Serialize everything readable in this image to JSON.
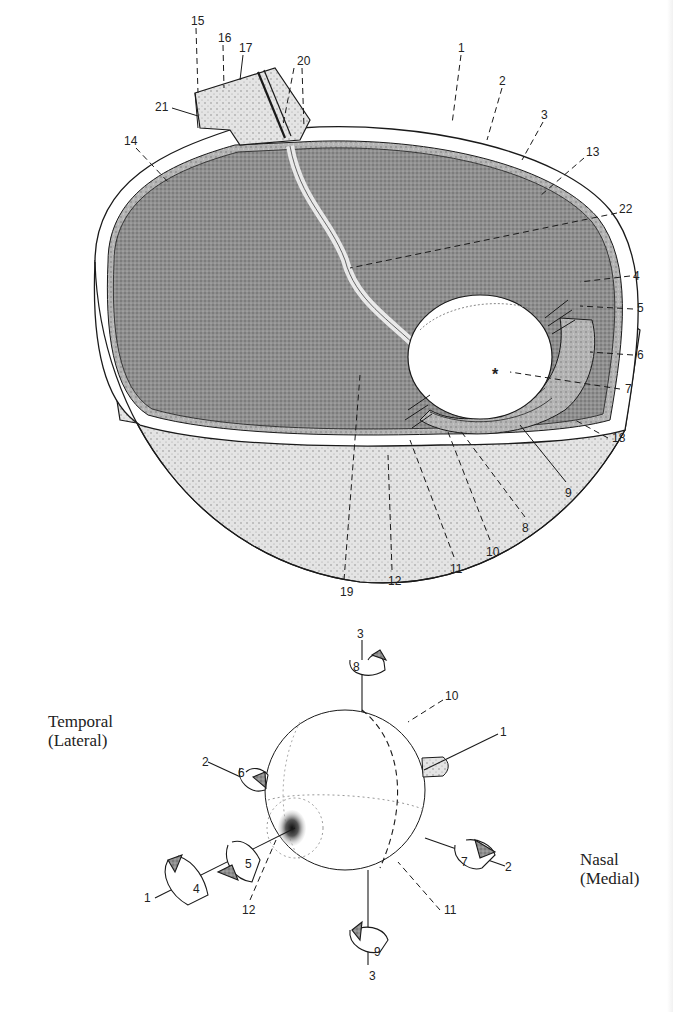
{
  "figure": {
    "top": {
      "title": "Eye cross-section (cut-away globe)",
      "labels": [
        {
          "id": "1",
          "text": "1",
          "x": 458,
          "y": 42
        },
        {
          "id": "2",
          "text": "2",
          "x": 499,
          "y": 75
        },
        {
          "id": "3",
          "text": "3",
          "x": 541,
          "y": 109
        },
        {
          "id": "13",
          "text": "13",
          "x": 586,
          "y": 146
        },
        {
          "id": "22",
          "text": "22",
          "x": 619,
          "y": 203
        },
        {
          "id": "4",
          "text": "4",
          "x": 633,
          "y": 270
        },
        {
          "id": "5",
          "text": "5",
          "x": 637,
          "y": 302
        },
        {
          "id": "6",
          "text": "6",
          "x": 637,
          "y": 349
        },
        {
          "id": "7",
          "text": "7",
          "x": 625,
          "y": 383
        },
        {
          "id": "18",
          "text": "18",
          "x": 612,
          "y": 432
        },
        {
          "id": "9",
          "text": "9",
          "x": 565,
          "y": 487
        },
        {
          "id": "8",
          "text": "8",
          "x": 522,
          "y": 522
        },
        {
          "id": "10",
          "text": "10",
          "x": 486,
          "y": 546
        },
        {
          "id": "11",
          "text": "11",
          "x": 450,
          "y": 563
        },
        {
          "id": "12",
          "text": "12",
          "x": 388,
          "y": 575
        },
        {
          "id": "19",
          "text": "19",
          "x": 340,
          "y": 586
        },
        {
          "id": "14",
          "text": "14",
          "x": 124,
          "y": 135
        },
        {
          "id": "21",
          "text": "21",
          "x": 161,
          "y": 101
        },
        {
          "id": "15",
          "text": "15",
          "x": 192,
          "y": 15
        },
        {
          "id": "16",
          "text": "16",
          "x": 219,
          "y": 32
        },
        {
          "id": "17",
          "text": "17",
          "x": 240,
          "y": 42
        },
        {
          "id": "20",
          "text": "20",
          "x": 297,
          "y": 55
        },
        {
          "id": "asterisk",
          "text": "*",
          "x": 492,
          "y": 368
        }
      ]
    },
    "bottom": {
      "title": "Extraocular muscle actions (globe with rotation arrows)",
      "side_labels": {
        "temporal": "Temporal\n(Lateral)",
        "nasal": "Nasal\n(Medial)"
      },
      "labels": [
        {
          "id": "b3-top",
          "text": "3",
          "x": 357,
          "y": 628
        },
        {
          "id": "b8",
          "text": "8",
          "x": 353,
          "y": 661
        },
        {
          "id": "b10",
          "text": "10",
          "x": 445,
          "y": 690
        },
        {
          "id": "b1-right",
          "text": "1",
          "x": 500,
          "y": 726
        },
        {
          "id": "b2-left",
          "text": "2",
          "x": 202,
          "y": 756
        },
        {
          "id": "b6",
          "text": "6",
          "x": 238,
          "y": 767
        },
        {
          "id": "b5",
          "text": "5",
          "x": 245,
          "y": 858
        },
        {
          "id": "b4",
          "text": "4",
          "x": 193,
          "y": 883
        },
        {
          "id": "b1-left",
          "text": "1",
          "x": 144,
          "y": 892
        },
        {
          "id": "b12",
          "text": "12",
          "x": 242,
          "y": 904
        },
        {
          "id": "b7",
          "text": "7",
          "x": 461,
          "y": 856
        },
        {
          "id": "b2-right",
          "text": "2",
          "x": 505,
          "y": 861
        },
        {
          "id": "b11",
          "text": "11",
          "x": 444,
          "y": 904
        },
        {
          "id": "b9",
          "text": "9",
          "x": 374,
          "y": 946
        },
        {
          "id": "b3-bottom",
          "text": "3",
          "x": 369,
          "y": 970
        }
      ]
    },
    "colors": {
      "ink": "#1a1a1a",
      "stipple_dark": "#8a8a8a",
      "stipple_mid": "#a9a9a9",
      "stipple_light": "#cfcfcf",
      "paper": "#ffffff"
    }
  }
}
